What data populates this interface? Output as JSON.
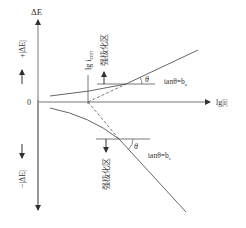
{
  "diagram": {
    "type": "tafel-polarization-plot",
    "y_axis": {
      "label": "ΔE",
      "positive_label": "+|ΔE|",
      "negative_label": "−|ΔE|"
    },
    "x_axis": {
      "label": "lg|i|",
      "origin_label": "0"
    },
    "corrosion_current_label": "lg i",
    "corrosion_current_subscript": "corr",
    "anodic": {
      "region_label": "强极化区",
      "angle_label": "θ",
      "slope_label": "tanθ=b",
      "slope_subscript": "a"
    },
    "cathodic": {
      "region_label": "强极化区",
      "angle_label": "θ",
      "slope_label": "tanθ=b",
      "slope_subscript": "c"
    },
    "colors": {
      "line": "#555555",
      "text": "#333333"
    }
  }
}
